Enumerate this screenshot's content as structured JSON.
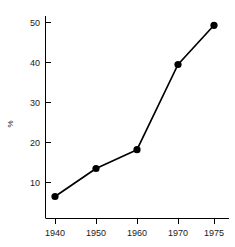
{
  "chart_data": {
    "type": "line",
    "title": "",
    "subtitle": "",
    "xlabel": "",
    "ylabel": "%",
    "categories": [
      "1940",
      "1950",
      "1960",
      "1970",
      "1975"
    ],
    "x": [
      1940,
      1950,
      1960,
      1970,
      1975
    ],
    "values": [
      6.5,
      13.5,
      18.2,
      39.5,
      49.3
    ],
    "series": [
      {
        "name": "",
        "values": [
          6.5,
          13.5,
          18.2,
          39.5,
          49.3
        ]
      }
    ],
    "ylim": [
      0,
      52
    ],
    "yticks": [
      10,
      20,
      30,
      40,
      50
    ],
    "ytick_labels": [
      "10",
      "20",
      "30",
      "40",
      "50"
    ],
    "xtick_labels": [
      "1940",
      "1950",
      "1960",
      "1970",
      "1975"
    ],
    "grid": false,
    "legend": false,
    "legend_position": "none",
    "x_axis_spacing": "categorical-even",
    "marker": "filled-circle",
    "line_color": "#000000",
    "marker_color": "#000000",
    "axis_color": "#000000",
    "background_color": "#ffffff"
  },
  "axes": {
    "y_axis_name": "percent-axis",
    "x_axis_name": "year-axis"
  }
}
